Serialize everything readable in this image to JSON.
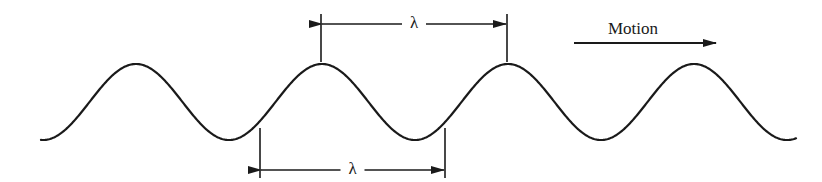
{
  "diagram": {
    "colors": {
      "stroke": "#1a1a1a",
      "background": "#ffffff"
    },
    "wave": {
      "x_start": 41,
      "x_end": 796,
      "midline_y": 102,
      "amplitude": 38,
      "period": 186,
      "first_peak_x": 136
    },
    "labels": {
      "top_wavelength": "λ",
      "bottom_wavelength": "λ",
      "motion": "Motion"
    },
    "top_dimension": {
      "x1": 321,
      "x2": 507,
      "y": 24,
      "tick_top": 14,
      "tick_bottom": 62
    },
    "bottom_dimension": {
      "x1": 260,
      "x2": 445,
      "y": 170,
      "tick_top": 128,
      "tick_bottom": 178
    },
    "motion_arrow": {
      "x1": 574,
      "x2": 716,
      "y": 43
    }
  }
}
